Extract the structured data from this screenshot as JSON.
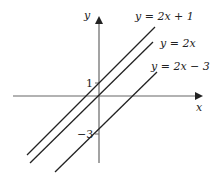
{
  "diagram": {
    "axes": {
      "x_label": "x",
      "y_label": "y",
      "y_ticks": [
        {
          "value": 1,
          "label": "1"
        },
        {
          "value": -3,
          "label": "−3"
        }
      ]
    },
    "lines": [
      {
        "equation": "y = 2x + 1",
        "slope": 2,
        "intercept": 1
      },
      {
        "equation": "y = 2x",
        "slope": 2,
        "intercept": 0
      },
      {
        "equation": "y = 2x − 3",
        "slope": 2,
        "intercept": -3
      }
    ],
    "colors": {
      "line": "#222222",
      "axis": "#555555",
      "background": "#ffffff"
    }
  }
}
